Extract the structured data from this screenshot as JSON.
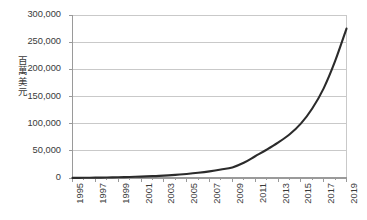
{
  "chart_data": {
    "type": "line",
    "title": "",
    "subtitle": "",
    "xlabel": "",
    "ylabel": "百萬美元",
    "ylabel_chars": "百\n萬\n美\n元",
    "x": [
      1995,
      1996,
      1997,
      1998,
      1999,
      2000,
      2001,
      2002,
      2003,
      2004,
      2005,
      2006,
      2007,
      2008,
      2009,
      2010,
      2011,
      2012,
      2013,
      2014,
      2015,
      2016,
      2017,
      2018,
      2019
    ],
    "values": [
      200,
      350,
      600,
      900,
      1300,
      1900,
      2600,
      3400,
      4400,
      5800,
      7500,
      9600,
      12200,
      15500,
      19500,
      28000,
      40000,
      52000,
      65000,
      80000,
      100000,
      128000,
      165000,
      215000,
      275000
    ],
    "series": [
      {
        "name": "百萬美元",
        "values": [
          200,
          350,
          600,
          900,
          1300,
          1900,
          2600,
          3400,
          4400,
          5800,
          7500,
          9600,
          12200,
          15500,
          19500,
          28000,
          40000,
          52000,
          65000,
          80000,
          100000,
          128000,
          165000,
          215000,
          275000
        ],
        "color": "#2b2b2b"
      }
    ],
    "x_tick_labels": [
      "1995",
      "1997",
      "1999",
      "2001",
      "2003",
      "2005",
      "2007",
      "2009",
      "2011",
      "2013",
      "2015",
      "2017",
      "2019"
    ],
    "x_tick_values": [
      1995,
      1997,
      1999,
      2001,
      2003,
      2005,
      2007,
      2009,
      2011,
      2013,
      2015,
      2017,
      2019
    ],
    "y_tick_labels": [
      "0",
      "50,000",
      "100,000",
      "150,000",
      "200,000",
      "250,000",
      "300,000"
    ],
    "y_tick_values": [
      0,
      50000,
      100000,
      150000,
      200000,
      250000,
      300000
    ],
    "xlim": [
      1995,
      2019
    ],
    "ylim": [
      0,
      300000
    ],
    "grid": true,
    "grid_axis": "y",
    "legend": false,
    "legend_position": "none",
    "colors": {
      "line": "#2b2b2b",
      "grid": "#c9c9c9",
      "axis": "#9a9a9a",
      "frame": "#b5b5b5",
      "text": "#3a3a3a",
      "background": "#ffffff"
    }
  }
}
